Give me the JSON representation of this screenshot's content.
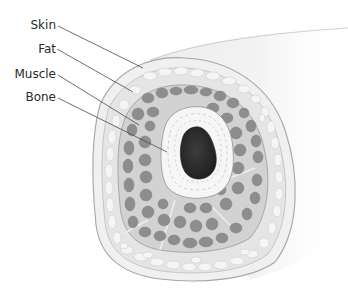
{
  "figure": {
    "labels": [
      {
        "id": "skin",
        "text": "Skin",
        "x": 0,
        "y": 18,
        "line": [
          58,
          26,
          143,
          68
        ]
      },
      {
        "id": "fat",
        "text": "Fat",
        "x": 0,
        "y": 42,
        "line": [
          57,
          49,
          133,
          92
        ]
      },
      {
        "id": "muscle",
        "text": "Muscle",
        "x": 0,
        "y": 67,
        "line": [
          58,
          75,
          139,
          125
        ]
      },
      {
        "id": "bone",
        "text": "Bone",
        "x": 0,
        "y": 90,
        "line": [
          58,
          98,
          167,
          152
        ]
      }
    ],
    "colors": {
      "background": "#ffffff",
      "skin": "#f1f1f1",
      "skin_edge": "#a9a9a9",
      "fat": "#e6e6e6",
      "fat_lobule": "#f4f4f4",
      "muscle_bg": "#d3d3d3",
      "muscle_bundle": "#8e8e8e",
      "bone_cortex": "#f6f6f6",
      "marrow": "#2f2f2f",
      "leader": "#4a4a4a",
      "label_text": "#2a2a2a"
    }
  }
}
